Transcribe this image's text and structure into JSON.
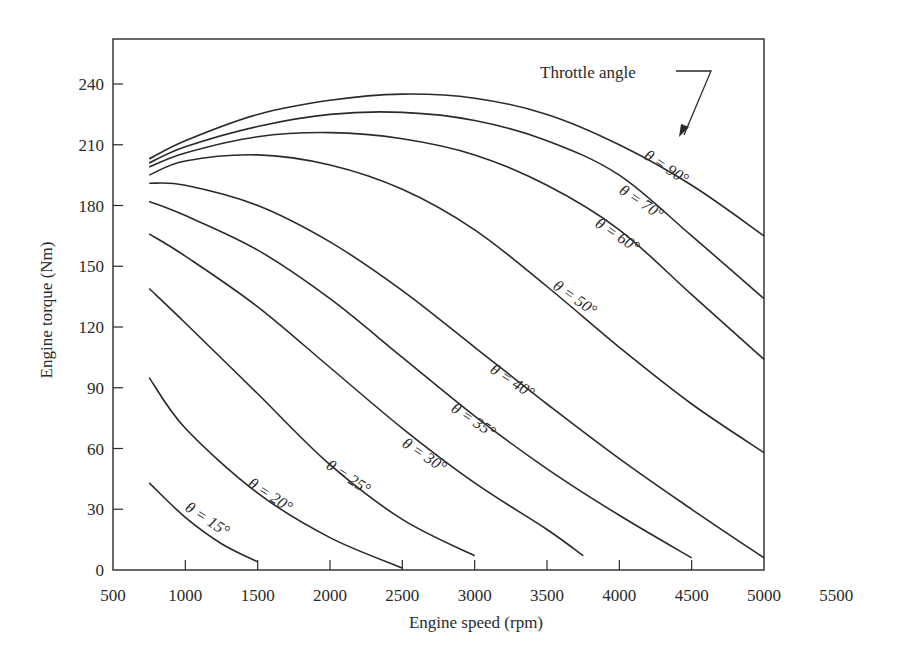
{
  "chart_data": {
    "type": "line",
    "title": "",
    "xlabel": "Engine speed (rpm)",
    "ylabel": "Engine torque (Nm)",
    "xlim": [
      500,
      5500
    ],
    "ylim": [
      0,
      260
    ],
    "xticks": [
      500,
      1000,
      1500,
      2000,
      2500,
      3000,
      3500,
      4000,
      4500,
      5000,
      5500
    ],
    "yticks": [
      0,
      30,
      60,
      90,
      120,
      150,
      180,
      210,
      240
    ],
    "grid": false,
    "legend": "none (inline curve labels)",
    "annotation": "Throttle angle",
    "series": [
      {
        "name": "θ = 90°",
        "label": "θ = 90°",
        "x": [
          750,
          1000,
          1500,
          2000,
          2500,
          3000,
          3500,
          4000,
          4500,
          5000
        ],
        "y": [
          203,
          212,
          225,
          232,
          235,
          233,
          225,
          210,
          190,
          165
        ],
        "label_pos": [
          643,
          158
        ],
        "label_rot": 33
      },
      {
        "name": "θ = 70°",
        "label": "θ = 70°",
        "x": [
          750,
          1000,
          1500,
          2000,
          2500,
          3000,
          3500,
          4000,
          4500,
          5000
        ],
        "y": [
          201,
          209,
          219,
          225,
          226,
          222,
          212,
          195,
          165,
          134
        ],
        "label_pos": [
          618,
          193
        ],
        "label_rot": 33
      },
      {
        "name": "θ = 60°",
        "label": "θ = 60°",
        "x": [
          750,
          1000,
          1500,
          2000,
          2500,
          3000,
          3500,
          4000,
          4500,
          5000
        ],
        "y": [
          199,
          206,
          214,
          216,
          213,
          205,
          190,
          168,
          136,
          104
        ],
        "label_pos": [
          594,
          226
        ],
        "label_rot": 33
      },
      {
        "name": "θ = 50°",
        "label": "θ = 50°",
        "x": [
          750,
          1000,
          1500,
          2000,
          2500,
          3000,
          3500,
          4000,
          4500,
          5000
        ],
        "y": [
          195,
          202,
          205,
          200,
          188,
          168,
          140,
          110,
          82,
          58
        ],
        "label_pos": [
          552,
          288
        ],
        "label_rot": 35
      },
      {
        "name": "θ = 40°",
        "label": "θ = 40°",
        "x": [
          750,
          1000,
          1500,
          2000,
          2500,
          3000,
          3500,
          4000,
          4500,
          5000
        ],
        "y": [
          191,
          190,
          180,
          162,
          138,
          110,
          82,
          55,
          30,
          6
        ],
        "label_pos": [
          489,
          372
        ],
        "label_rot": 33
      },
      {
        "name": "θ = 35°",
        "label": "θ = 35°",
        "x": [
          750,
          1000,
          1500,
          2000,
          2500,
          3000,
          3500,
          4000,
          4500
        ],
        "y": [
          182,
          175,
          158,
          134,
          105,
          76,
          50,
          27,
          6
        ],
        "label_pos": [
          450,
          411
        ],
        "label_rot": 33
      },
      {
        "name": "θ = 30°",
        "label": "θ = 30°",
        "x": [
          750,
          1000,
          1500,
          2000,
          2500,
          3000,
          3500,
          3750
        ],
        "y": [
          166,
          155,
          130,
          100,
          70,
          43,
          20,
          7
        ],
        "label_pos": [
          401,
          446
        ],
        "label_rot": 33
      },
      {
        "name": "θ = 25°",
        "label": "θ = 25°",
        "x": [
          750,
          1000,
          1500,
          2000,
          2500,
          3000
        ],
        "y": [
          139,
          122,
          87,
          52,
          25,
          7
        ],
        "label_pos": [
          325,
          468
        ],
        "label_rot": 33
      },
      {
        "name": "θ = 20°",
        "label": "θ = 20°",
        "x": [
          750,
          1000,
          1500,
          2000,
          2500
        ],
        "y": [
          95,
          70,
          38,
          16,
          1
        ],
        "label_pos": [
          247,
          486
        ],
        "label_rot": 33
      },
      {
        "name": "θ = 15°",
        "label": "θ = 15°",
        "x": [
          750,
          1000,
          1250,
          1500
        ],
        "y": [
          43,
          26,
          13,
          4
        ],
        "label_pos": [
          184,
          510
        ],
        "label_rot": 33
      }
    ]
  },
  "colors": {
    "line": "#2a2a2a",
    "background": "#ffffff"
  }
}
